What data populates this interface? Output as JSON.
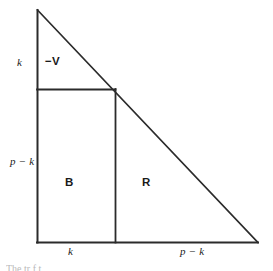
{
  "figure": {
    "type": "geometric-diagram",
    "background_color": "#ffffff",
    "line_color": "#2b2b2b",
    "label_color": "#1a1a1a",
    "geometry": {
      "triangle": {
        "apex": {
          "x": 37,
          "y": 10
        },
        "bottom_left": {
          "x": 37,
          "y": 242
        },
        "bottom_right": {
          "x": 258,
          "y": 242
        }
      },
      "horizontal_divider": {
        "x1": 37,
        "y1": 89,
        "x2": 115,
        "y2": 89
      },
      "vertical_divider": {
        "x1": 115,
        "y1": 89,
        "x2": 115,
        "y2": 242
      }
    },
    "labels": {
      "k_left": "k",
      "minus_v": "−V",
      "p_minus_k_left": "p − k",
      "region_b": "B",
      "region_r": "R",
      "k_bottom": "k",
      "p_minus_k_bottom": "p − k"
    },
    "caption_fragment": "The      tr     f                  t"
  }
}
